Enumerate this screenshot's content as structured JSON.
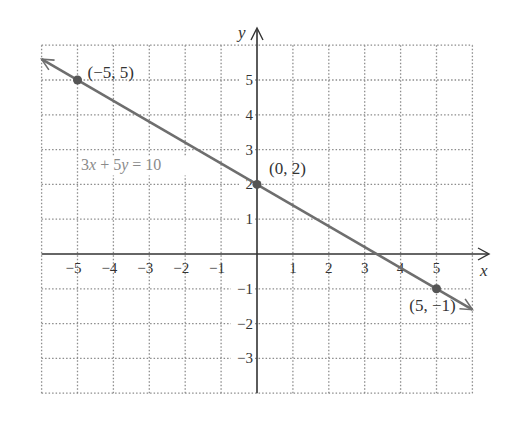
{
  "chart_data": {
    "type": "line",
    "title": "",
    "xlabel": "x",
    "ylabel": "y",
    "xlim": [
      -6,
      6
    ],
    "ylim": [
      -4,
      6
    ],
    "grid": true,
    "grid_style": "dotted",
    "x_ticks": [
      -5,
      -4,
      -3,
      -2,
      -1,
      1,
      2,
      3,
      4,
      5
    ],
    "y_ticks": [
      -3,
      -2,
      -1,
      1,
      2,
      3,
      4,
      5
    ],
    "series": [
      {
        "name": "3x + 5y = 10",
        "equation": "3x + 5y = 10",
        "slope": -0.6,
        "intercept": 2,
        "x": [
          -6,
          6
        ],
        "y": [
          5.6,
          -1.6
        ]
      }
    ],
    "points": [
      {
        "x": -5,
        "y": 5,
        "label": "(−5, 5)"
      },
      {
        "x": 0,
        "y": 2,
        "label": "(0, 2)"
      },
      {
        "x": 5,
        "y": -1,
        "label": "(5, −1)"
      }
    ],
    "annotations": [
      {
        "text": "3x + 5y = 10",
        "x": -4.9,
        "y": 2.4
      }
    ]
  },
  "colors": {
    "grid": "#8c8c8c",
    "axis": "#333333",
    "line": "#6e6e6e",
    "point": "#555555",
    "equation_label": "#8a8a8a"
  }
}
